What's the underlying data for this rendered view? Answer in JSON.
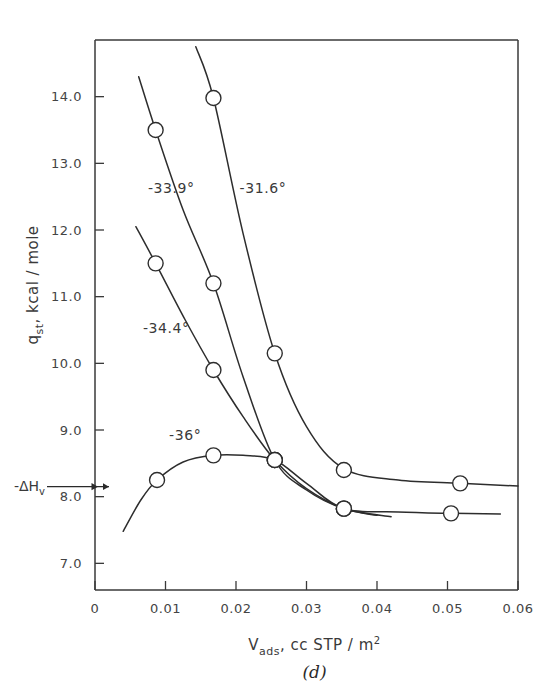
{
  "figure": {
    "panel_label": "(d)",
    "xlabel_main": "V",
    "xlabel_sub": "ads",
    "xlabel_rest": ", cc  STP / m",
    "xlabel_sup": "2",
    "ylabel_main": "q",
    "ylabel_sub": "st",
    "ylabel_rest": ", kcal / mole",
    "annotation_label": "-ΔH",
    "annotation_sub": "v"
  },
  "chart_data": {
    "type": "line",
    "title": "",
    "xlabel": "V_ads, cc STP / m²",
    "ylabel": "q_st, kcal / mole",
    "xlim": [
      0,
      0.06
    ],
    "ylim": [
      6.6,
      14.85
    ],
    "grid": false,
    "legend": "inline-curve-labels",
    "xticks": [
      0,
      0.01,
      0.02,
      0.03,
      0.04,
      0.05,
      0.06
    ],
    "xtick_labels": [
      "0",
      "0.01",
      "0.02",
      "0.03",
      "0.04",
      "0.05",
      "0.06"
    ],
    "yticks": [
      14.0,
      13.0,
      12.0,
      11.0,
      10.0,
      9.0,
      8.0,
      7.0
    ],
    "ytick_labels": [
      "14.0",
      "13.0",
      "12.0",
      "11.0",
      "10.0",
      "9.0",
      "8.0",
      "7.0"
    ],
    "annotations": [
      {
        "text": "-ΔH_v",
        "y": 8.15,
        "type": "axis-arrow-marker"
      }
    ],
    "series": [
      {
        "name": "-31.6°",
        "label": "-31.6°",
        "label_x": 0.0205,
        "label_y": 12.55,
        "points": [
          {
            "x": 0.0168,
            "y": 13.98
          },
          {
            "x": 0.0255,
            "y": 10.15
          },
          {
            "x": 0.0353,
            "y": 8.4
          },
          {
            "x": 0.0518,
            "y": 8.2
          }
        ],
        "path": [
          {
            "x": 0.0143,
            "y": 14.75
          },
          {
            "x": 0.0168,
            "y": 13.98
          },
          {
            "x": 0.021,
            "y": 11.95
          },
          {
            "x": 0.0255,
            "y": 10.15
          },
          {
            "x": 0.03,
            "y": 9.05
          },
          {
            "x": 0.0353,
            "y": 8.42
          },
          {
            "x": 0.043,
            "y": 8.25
          },
          {
            "x": 0.0518,
            "y": 8.2
          },
          {
            "x": 0.06,
            "y": 8.16
          }
        ]
      },
      {
        "name": "-33.9°",
        "label": "-33.9°",
        "label_x": 0.0075,
        "label_y": 12.55,
        "points": [
          {
            "x": 0.0086,
            "y": 13.5
          },
          {
            "x": 0.0168,
            "y": 11.2
          },
          {
            "x": 0.0255,
            "y": 8.55
          },
          {
            "x": 0.0353,
            "y": 7.82
          }
        ],
        "path": [
          {
            "x": 0.0062,
            "y": 14.3
          },
          {
            "x": 0.0086,
            "y": 13.5
          },
          {
            "x": 0.0125,
            "y": 12.3
          },
          {
            "x": 0.0168,
            "y": 11.2
          },
          {
            "x": 0.021,
            "y": 9.8
          },
          {
            "x": 0.0255,
            "y": 8.55
          },
          {
            "x": 0.03,
            "y": 8.1
          },
          {
            "x": 0.0353,
            "y": 7.82
          },
          {
            "x": 0.042,
            "y": 7.7
          }
        ]
      },
      {
        "name": "-34.4°",
        "label": "-34.4°",
        "label_x": 0.0068,
        "label_y": 10.45,
        "points": [
          {
            "x": 0.0086,
            "y": 11.5
          },
          {
            "x": 0.0168,
            "y": 9.9
          },
          {
            "x": 0.0255,
            "y": 8.55
          },
          {
            "x": 0.0353,
            "y": 7.82
          }
        ],
        "path": [
          {
            "x": 0.0058,
            "y": 12.05
          },
          {
            "x": 0.0086,
            "y": 11.5
          },
          {
            "x": 0.0128,
            "y": 10.65
          },
          {
            "x": 0.0168,
            "y": 9.9
          },
          {
            "x": 0.021,
            "y": 9.2
          },
          {
            "x": 0.0255,
            "y": 8.55
          },
          {
            "x": 0.03,
            "y": 8.12
          },
          {
            "x": 0.0353,
            "y": 7.82
          },
          {
            "x": 0.04,
            "y": 7.72
          }
        ]
      },
      {
        "name": "-36°",
        "label": "-36°",
        "label_x": 0.0105,
        "label_y": 8.85,
        "points": [
          {
            "x": 0.0088,
            "y": 8.25
          },
          {
            "x": 0.0168,
            "y": 8.62
          },
          {
            "x": 0.0255,
            "y": 8.55
          },
          {
            "x": 0.0353,
            "y": 7.82
          },
          {
            "x": 0.0505,
            "y": 7.75
          }
        ],
        "path": [
          {
            "x": 0.004,
            "y": 7.48
          },
          {
            "x": 0.0065,
            "y": 7.95
          },
          {
            "x": 0.0088,
            "y": 8.25
          },
          {
            "x": 0.0125,
            "y": 8.52
          },
          {
            "x": 0.0168,
            "y": 8.62
          },
          {
            "x": 0.021,
            "y": 8.62
          },
          {
            "x": 0.0255,
            "y": 8.55
          },
          {
            "x": 0.03,
            "y": 8.2
          },
          {
            "x": 0.0353,
            "y": 7.82
          },
          {
            "x": 0.043,
            "y": 7.77
          },
          {
            "x": 0.0505,
            "y": 7.75
          },
          {
            "x": 0.0575,
            "y": 7.74
          }
        ]
      }
    ]
  }
}
